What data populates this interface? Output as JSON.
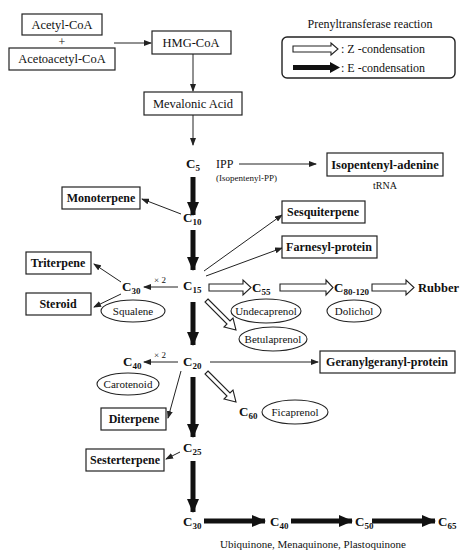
{
  "legend": {
    "title": "Prenyltransferase reaction",
    "z_label": ": Z -condensation",
    "e_label": ": E -condensation"
  },
  "boxes": {
    "acetyl_coa": "Acetyl-CoA",
    "plus": "+",
    "acetoacetyl_coa": "Acetoacetyl-CoA",
    "hmg_coa": "HMG-CoA",
    "mevalonic_acid": "Mevalonic Acid",
    "isopentenyl_adenine": "Isopentenyl-adenine",
    "monoterpene": "Monoterpene",
    "sesquiterpene": "Sesquiterpene",
    "farnesyl_protein": "Farnesyl-protein",
    "triterpene": "Triterpene",
    "steroid": "Steroid",
    "geranylgeranyl_protein": "Geranylgeranyl-protein",
    "diterpene": "Diterpene",
    "sesterterpene": "Sesterterpene"
  },
  "ellipses": {
    "squalene": "Squalene",
    "undecaprenol": "Undecaprenol",
    "dolichol": "Dolichol",
    "betulaprenol": "Betulaprenol",
    "carotenoid": "Carotenoid",
    "ficaprenol": "Ficaprenol"
  },
  "labels": {
    "ipp": "IPP",
    "ipp_full": "(Isopentenyl-PP)",
    "trna": "tRNA",
    "times2_a": "× 2",
    "times2_b": "× 2",
    "rubber": "Rubber",
    "quinones": "Ubiquinone, Menaquinone, Plastoquinone"
  },
  "nodes": {
    "c5": {
      "main": "C",
      "sub": "5"
    },
    "c10": {
      "main": "C",
      "sub": "10"
    },
    "c15": {
      "main": "C",
      "sub": "15"
    },
    "c20": {
      "main": "C",
      "sub": "20"
    },
    "c25": {
      "main": "C",
      "sub": "25"
    },
    "c30a": {
      "main": "C",
      "sub": "30"
    },
    "c30b": {
      "main": "C",
      "sub": "30"
    },
    "c40a": {
      "main": "C",
      "sub": "40"
    },
    "c40b": {
      "main": "C",
      "sub": "40"
    },
    "c50": {
      "main": "C",
      "sub": "50"
    },
    "c55": {
      "main": "C",
      "sub": "55"
    },
    "c60": {
      "main": "C",
      "sub": "60"
    },
    "c65": {
      "main": "C",
      "sub": "65"
    },
    "c80": {
      "main": "C",
      "sub": "80-120"
    }
  }
}
